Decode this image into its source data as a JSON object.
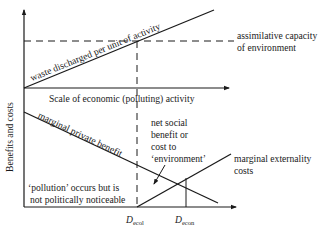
{
  "diagram": {
    "y_axis_label": "Benefits and costs",
    "upper_panel": {
      "x_axis_label": "Scale of economic (polluting) activity",
      "line_label": "waste discharged per unit of activity",
      "threshold_label_line1": "assimilative capacity",
      "threshold_label_line2": "of environment"
    },
    "lower_panel": {
      "benefit_curve_label": "marginal private benefit",
      "cost_curve_label_line1": "marginal externality",
      "cost_curve_label_line2": "costs",
      "net_label_line1": "net social",
      "net_label_line2": "benefit or",
      "net_label_line3": "cost to",
      "net_label_line4": "‘environment’",
      "pollution_note_line1": "‘pollution’ occurs but is",
      "pollution_note_line2": "not politically noticeable",
      "d_ecol_main": "D",
      "d_ecol_sub": "ecol",
      "d_econ_main": "D",
      "d_econ_sub": "econ"
    },
    "colors": {
      "ink": "#1a1a1a",
      "background": "#ffffff"
    }
  }
}
